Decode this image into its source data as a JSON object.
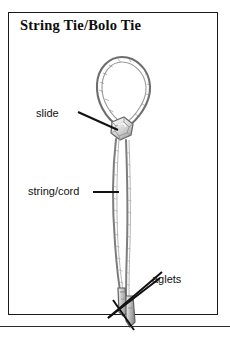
{
  "plate": {
    "title": "String Tie/Bolo Tie",
    "frame_color": "#1a1a1a",
    "background_color": "#ffffff",
    "ink_color": "#111111"
  },
  "illustration": {
    "name": "bolo-tie-drawing",
    "style": "pencil line drawing",
    "parts": [
      {
        "id": "loop",
        "description": "oval neck loop of braided cord"
      },
      {
        "id": "slide",
        "description": "faceted ornamental slide at base of loop"
      },
      {
        "id": "cords",
        "description": "two hanging cord ends"
      },
      {
        "id": "aglets",
        "description": "metal tips at the cord ends"
      }
    ]
  },
  "labels": [
    {
      "id": "slide",
      "text": "slide",
      "leader": "diagonal-down-right"
    },
    {
      "id": "cord",
      "text": "string/cord",
      "leader": "horizontal-right"
    },
    {
      "id": "aglets",
      "text": "aglets",
      "leader": "diagonal-down-left"
    }
  ]
}
